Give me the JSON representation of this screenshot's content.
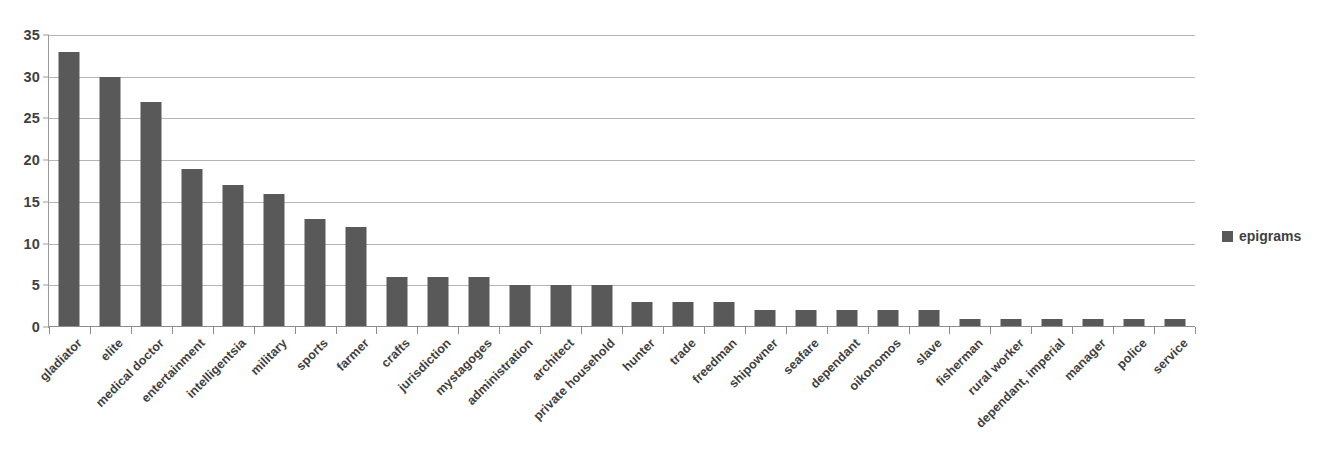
{
  "chart_data": {
    "type": "bar",
    "title": "",
    "subtitle": "",
    "xlabel": "",
    "ylabel": "",
    "ylim": [
      0,
      35
    ],
    "ytick_step": 5,
    "yticks": [
      0,
      5,
      10,
      15,
      20,
      25,
      30,
      35
    ],
    "ytick_labels": [
      "0",
      "5",
      "10",
      "15",
      "20",
      "25",
      "30",
      "35"
    ],
    "grid": true,
    "grid_axis": "y",
    "legend_position": "right",
    "legend": [
      "epigrams"
    ],
    "bar_color": "#595959",
    "gridline_color": "#b5b5b5",
    "axis_color": "#8d8d8d",
    "text_color": "#3f3f3f",
    "background": "#ffffff",
    "categories": [
      "gladiator",
      "elite",
      "medical doctor",
      "entertainment",
      "intelligentsia",
      "military",
      "sports",
      "farmer",
      "crafts",
      "jurisdiction",
      "mystagoges",
      "administration",
      "architect",
      "private household",
      "hunter",
      "trade",
      "freedman",
      "shipowner",
      "seafare",
      "dependant",
      "oikonomos",
      "slave",
      "fisherman",
      "rural worker",
      "dependant, imperial",
      "manager",
      "police",
      "service"
    ],
    "series": [
      {
        "name": "epigrams",
        "values": [
          33,
          30,
          27,
          19,
          17,
          16,
          13,
          12,
          6,
          6,
          6,
          5,
          5,
          5,
          3,
          3,
          3,
          2,
          2,
          2,
          2,
          2,
          1,
          1,
          1,
          1,
          1,
          1
        ]
      }
    ]
  },
  "legend": {
    "entries": [
      {
        "label": "epigrams",
        "color": "#595959"
      }
    ]
  }
}
